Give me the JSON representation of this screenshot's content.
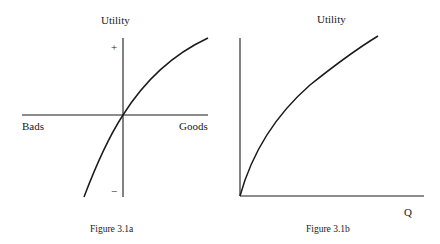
{
  "figure_a": {
    "y_label": "Utility",
    "plus_mark": "+",
    "minus_mark": "−",
    "x_left_label": "Bads",
    "x_right_label": "Goods",
    "caption": "Figure 3.1a"
  },
  "figure_b": {
    "y_label": "Utility",
    "x_label": "Q",
    "caption": "Figure 3.1b"
  },
  "colors": {
    "ink": "#1a1a1a",
    "background": "#ffffff"
  }
}
